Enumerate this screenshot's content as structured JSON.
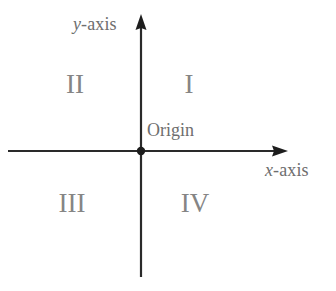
{
  "diagram": {
    "kind": "cartesian-coordinate-plane",
    "background_color": "#ffffff",
    "axis_color": "#2a2a2a",
    "label_color": "#6e6e6e",
    "quadrant_label_color": "#858585",
    "origin_point": {
      "x": 141,
      "y": 151,
      "radius": 4
    },
    "axes": [
      {
        "name": "x-axis",
        "orientation": "horizontal",
        "from": {
          "x": 8,
          "y": 151
        },
        "to": {
          "x": 288,
          "y": 151
        },
        "arrowhead": "end"
      },
      {
        "name": "y-axis",
        "orientation": "vertical",
        "from": {
          "x": 141,
          "y": 277
        },
        "to": {
          "x": 141,
          "y": 14
        },
        "arrowhead": "end"
      }
    ]
  },
  "labels": {
    "y_axis": {
      "variable": "y",
      "suffix": "-axis"
    },
    "x_axis": {
      "variable": "x",
      "suffix": "-axis"
    },
    "origin": "Origin"
  },
  "quadrants": [
    {
      "id": "quadrant-1",
      "numeral": "I",
      "position": "top-right"
    },
    {
      "id": "quadrant-2",
      "numeral": "II",
      "position": "top-left"
    },
    {
      "id": "quadrant-3",
      "numeral": "III",
      "position": "bottom-left"
    },
    {
      "id": "quadrant-4",
      "numeral": "IV",
      "position": "bottom-right"
    }
  ]
}
